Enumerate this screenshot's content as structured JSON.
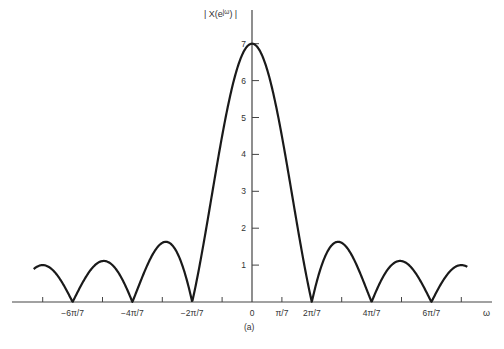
{
  "chart_data": {
    "type": "line",
    "title": "",
    "caption": "(a)",
    "xlabel": "ω",
    "ylabel": "| X(e^{jω}) |",
    "function": "|sin(7ω/2) / sin(ω/2)|",
    "xlim_pi_over_7": [
      -7.3,
      7.2
    ],
    "ylim": [
      0,
      7
    ],
    "grid": false,
    "legend": null,
    "x_tick_labels": [
      "−6π/7",
      "−4π/7",
      "−2π/7",
      "0",
      "π/7",
      "2π/7",
      "4π/7",
      "6π/7"
    ],
    "x_tick_values_pi_over_7": [
      -6,
      -4,
      -2,
      0,
      1,
      2,
      4,
      6
    ],
    "x_minor_ticks_pi_over_7": [
      -7,
      -5,
      -3,
      -1,
      1,
      3,
      5,
      7
    ],
    "y_ticks": [
      1,
      2,
      3,
      4,
      5,
      6,
      7
    ],
    "y_tick_labels": [
      "1",
      "2",
      "3",
      "4",
      "5",
      "6",
      "7"
    ],
    "peak": {
      "x": 0,
      "y": 7
    },
    "zeros_pi_over_7": [
      -6,
      -4,
      -2,
      2,
      4,
      6
    ],
    "sidelobe_peaks": [
      {
        "x_pi_over_7": -5,
        "y": 1.11
      },
      {
        "x_pi_over_7": -3,
        "y": 1.6
      },
      {
        "x_pi_over_7": 3,
        "y": 1.6
      },
      {
        "x_pi_over_7": 5,
        "y": 1.11
      }
    ]
  },
  "labels": {
    "ylabel": "| X(e",
    "ylabel_sup": "jω",
    "ylabel_end": ") |",
    "xlabel": "ω",
    "caption": "(a)"
  }
}
